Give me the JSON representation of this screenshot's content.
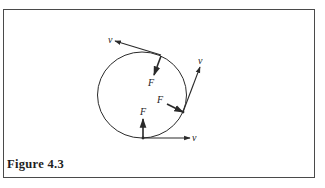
{
  "figure": {
    "caption": "Figure 4.3",
    "colors": {
      "stroke": "#2a2a2a",
      "frame": "#4a4a4a",
      "background": "#ffffff"
    }
  },
  "diagram": {
    "circle": {
      "cx": 142,
      "cy": 95,
      "rx": 44.5,
      "ry": 43
    },
    "points": [
      {
        "name": "top",
        "at": [
          161,
          55
        ],
        "velocity": {
          "label": "v",
          "to": [
            115,
            41
          ],
          "label_pos": [
            108,
            43
          ]
        },
        "force": {
          "label": "F",
          "to": [
            154,
            75
          ],
          "label_pos": [
            148,
            86
          ]
        }
      },
      {
        "name": "right",
        "at": [
          183,
          112
        ],
        "velocity": {
          "label": "v",
          "to": [
            200,
            67
          ],
          "label_pos": [
            198,
            64
          ]
        },
        "force": {
          "label": "F",
          "from": [
            167,
            104
          ],
          "label_pos": [
            157,
            103
          ]
        }
      },
      {
        "name": "bottom",
        "at": [
          143,
          138
        ],
        "velocity": {
          "label": "v",
          "to": [
            190,
            138
          ],
          "label_pos": [
            192,
            141
          ]
        },
        "force": {
          "label": "F",
          "to": [
            143,
            119
          ],
          "label_pos": [
            140,
            115
          ]
        }
      }
    ]
  }
}
